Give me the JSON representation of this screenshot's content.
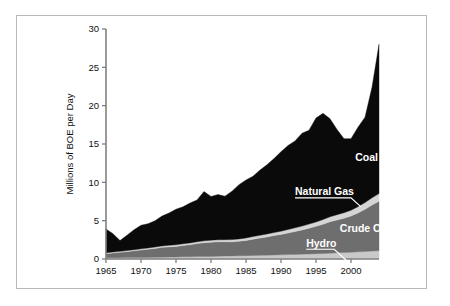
{
  "chart_data": {
    "type": "area",
    "stacked": true,
    "title": "",
    "xlabel": "",
    "ylabel": "Millions of BOE per Day",
    "xlim": [
      1965,
      2004
    ],
    "ylim": [
      0,
      30
    ],
    "ytick_values": [
      0,
      5,
      10,
      15,
      20,
      25,
      30
    ],
    "ytick_labels": [
      "0",
      "5",
      "10",
      "15",
      "20",
      "25",
      "30"
    ],
    "xtick_values": [
      1965,
      1970,
      1975,
      1980,
      1985,
      1990,
      1995,
      2000
    ],
    "xtick_labels": [
      "1965",
      "1970",
      "1975",
      "1980",
      "1985",
      "1990",
      "1995",
      "2000"
    ],
    "grid": false,
    "legend_position": "inline-annotations",
    "x": [
      1965,
      1966,
      1967,
      1968,
      1969,
      1970,
      1971,
      1972,
      1973,
      1974,
      1975,
      1976,
      1977,
      1978,
      1979,
      1980,
      1981,
      1982,
      1983,
      1984,
      1985,
      1986,
      1987,
      1988,
      1989,
      1990,
      1991,
      1992,
      1993,
      1994,
      1995,
      1996,
      1997,
      1998,
      1999,
      2000,
      2001,
      2002,
      2003,
      2004
    ],
    "series": [
      {
        "name": "Hydro",
        "color": "#c9c9c9",
        "values": [
          0.15,
          0.16,
          0.17,
          0.18,
          0.19,
          0.2,
          0.21,
          0.22,
          0.24,
          0.25,
          0.26,
          0.28,
          0.29,
          0.31,
          0.32,
          0.34,
          0.36,
          0.38,
          0.4,
          0.42,
          0.44,
          0.46,
          0.48,
          0.5,
          0.53,
          0.55,
          0.58,
          0.6,
          0.63,
          0.66,
          0.69,
          0.72,
          0.76,
          0.8,
          0.84,
          0.88,
          0.93,
          0.98,
          1.03,
          1.08
        ]
      },
      {
        "name": "Crude Oil",
        "color": "#6e6e6e",
        "values": [
          0.55,
          0.62,
          0.7,
          0.78,
          0.88,
          0.97,
          1.06,
          1.16,
          1.28,
          1.33,
          1.38,
          1.48,
          1.58,
          1.7,
          1.8,
          1.86,
          1.88,
          1.86,
          1.84,
          1.9,
          1.98,
          2.12,
          2.25,
          2.38,
          2.52,
          2.66,
          2.82,
          2.98,
          3.16,
          3.36,
          3.58,
          3.82,
          4.1,
          4.3,
          4.48,
          4.72,
          5.08,
          5.5,
          6.0,
          6.45
        ]
      },
      {
        "name": "Natural Gas",
        "color": "#d5d5d5",
        "values": [
          0.12,
          0.13,
          0.13,
          0.14,
          0.15,
          0.16,
          0.17,
          0.18,
          0.19,
          0.2,
          0.21,
          0.22,
          0.23,
          0.24,
          0.25,
          0.26,
          0.27,
          0.28,
          0.29,
          0.3,
          0.32,
          0.34,
          0.36,
          0.38,
          0.4,
          0.42,
          0.45,
          0.48,
          0.5,
          0.53,
          0.56,
          0.6,
          0.64,
          0.68,
          0.72,
          0.76,
          0.82,
          0.88,
          0.95,
          1.0
        ]
      },
      {
        "name": "Coal",
        "color": "#0a0a0a",
        "values": [
          3.08,
          2.39,
          1.4,
          2.0,
          2.58,
          3.07,
          3.16,
          3.44,
          3.89,
          4.22,
          4.65,
          4.82,
          5.2,
          5.45,
          6.43,
          5.7,
          5.89,
          5.68,
          6.32,
          7.08,
          7.56,
          7.88,
          8.51,
          9.04,
          9.65,
          10.37,
          10.95,
          11.34,
          12.11,
          12.25,
          13.57,
          13.86,
          12.8,
          11.12,
          9.66,
          9.34,
          10.37,
          11.14,
          14.42,
          19.47
        ]
      }
    ],
    "annotations": [
      {
        "label": "Coal",
        "x": 2000.6,
        "y": 12.8
      },
      {
        "label": "Natural Gas",
        "x": 1992.0,
        "y": 8.3
      },
      {
        "label": "Crude Oil",
        "x": 1998.4,
        "y": 3.5
      },
      {
        "label": "Hydro",
        "x": 1993.6,
        "y": 1.6
      }
    ]
  }
}
